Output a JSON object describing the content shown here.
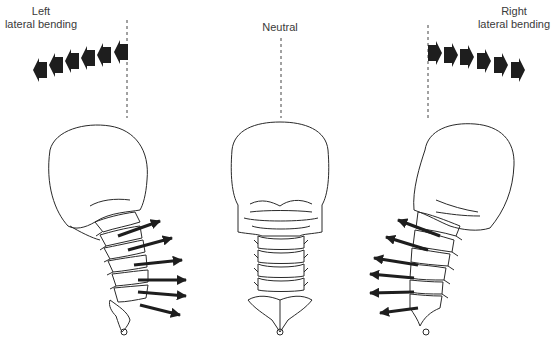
{
  "figure": {
    "panels": [
      {
        "id": "left",
        "label_line1": "Left",
        "label_line2": "lateral bending",
        "head_tilt": "left",
        "force_direction": "right (ipsilateral compression, contralateral tension)",
        "arrow_count": 6
      },
      {
        "id": "neutral",
        "label_line1": "Neutral",
        "label_line2": "",
        "head_tilt": "none",
        "arrow_count": 0
      },
      {
        "id": "right",
        "label_line1": "Right",
        "label_line2": "lateral bending",
        "head_tilt": "right",
        "force_direction": "left",
        "arrow_count": 6
      }
    ],
    "colors": {
      "line": "#2a2a2a",
      "arrow": "#1e1e1e",
      "background": "#ffffff"
    }
  }
}
